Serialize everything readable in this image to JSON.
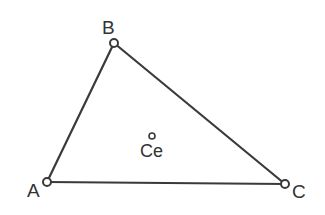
{
  "figure": {
    "type": "geometry-diagram",
    "background_color": "#ffffff",
    "stroke_color": "#3a3a3a",
    "text_color": "#333333"
  },
  "labels": {
    "vertex_a": "A",
    "vertex_b": "B",
    "vertex_c": "C",
    "centroid": "Ce"
  },
  "geometry": {
    "vertices": [
      {
        "name": "A",
        "x": 47,
        "y": 182,
        "marker": "open-circle",
        "radius": 4
      },
      {
        "name": "B",
        "x": 114,
        "y": 43,
        "marker": "open-circle",
        "radius": 4
      },
      {
        "name": "C",
        "x": 285,
        "y": 184,
        "marker": "open-circle",
        "radius": 4
      }
    ],
    "edges": [
      {
        "name": "AB",
        "from": "A",
        "to": "B"
      },
      {
        "name": "BC",
        "from": "B",
        "to": "C"
      },
      {
        "name": "CA",
        "from": "C",
        "to": "A"
      }
    ],
    "points": [
      {
        "name": "Ce",
        "x": 152,
        "y": 136,
        "marker": "open-circle",
        "radius": 3
      }
    ],
    "stroke_width": 2.2
  }
}
